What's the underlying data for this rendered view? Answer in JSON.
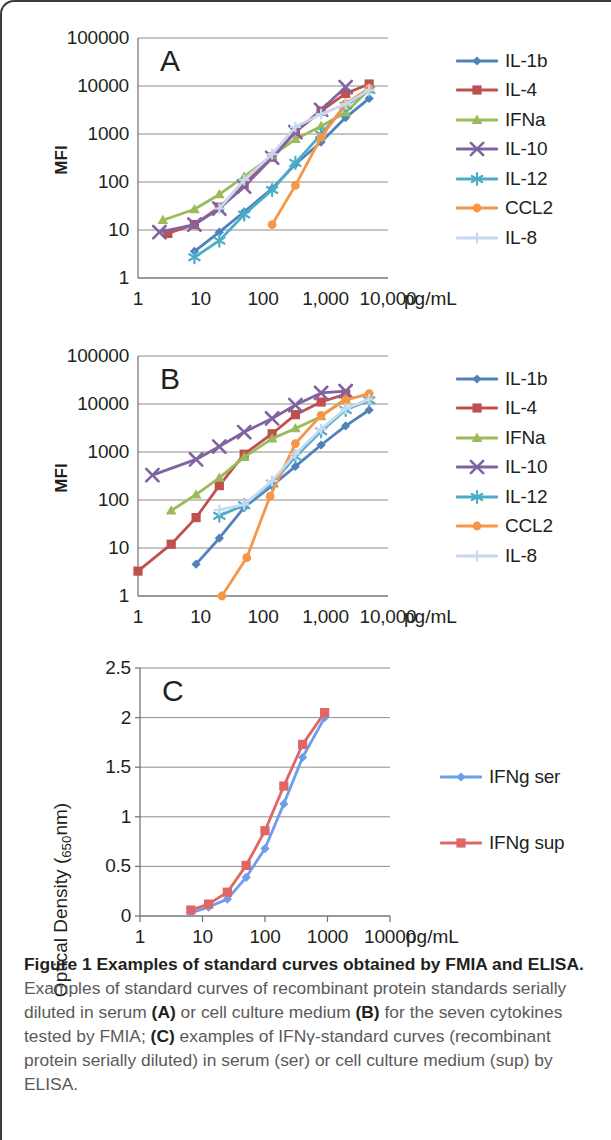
{
  "figure": {
    "caption_lead": "Figure 1 Examples of standard curves obtained by FMIA and ELISA.",
    "caption_body_1": " Examples of standard curves of recombinant protein standards serially diluted in serum ",
    "caption_ref_a": "(A)",
    "caption_body_2": " or cell culture medium ",
    "caption_ref_b": "(B)",
    "caption_body_3": " for the seven cytokines tested by FMIA; ",
    "caption_ref_c": "(C)",
    "caption_body_4": " examples of IFNγ-standard curves (recombinant protein serially diluted) in serum (ser) or cell culture medium (sup) by ELISA."
  },
  "colors": {
    "il1b": "#4f81bd",
    "il4": "#c0504d",
    "ifna": "#9bbb59",
    "il10": "#8064a2",
    "il12": "#4bacc6",
    "ccl2": "#f79646",
    "il8": "#c6d9f0",
    "ifng_ser": "#6d9eeb",
    "ifng_sup": "#e06666",
    "grid": "#808080",
    "axis": "#808080",
    "text": "#231f20"
  },
  "chart_data": [
    {
      "id": "panel-a",
      "type": "line",
      "panel_letter": "A",
      "title": "",
      "xlabel": "pg/mL",
      "ylabel": "MFI",
      "xscale": "log",
      "yscale": "log",
      "xlim": [
        1,
        10000
      ],
      "ylim": [
        1,
        100000
      ],
      "xticks": [
        1,
        10,
        100,
        1000,
        10000
      ],
      "xticklabels": [
        "1",
        "10",
        "100",
        "1,000",
        "10,000"
      ],
      "xunit_label": "pg/mL",
      "yticks": [
        1,
        10,
        100,
        1000,
        10000,
        100000
      ],
      "yticklabels": [
        "1",
        "10",
        "100",
        "1000",
        "10000",
        "100000"
      ],
      "grid": true,
      "legend_position": "right",
      "series": [
        {
          "name": "IL-1b",
          "color": "#4f81bd",
          "marker": "diamond",
          "x": [
            8,
            20,
            50,
            140,
            330,
            850,
            2100,
            5000
          ],
          "y": [
            3.6,
            9,
            24,
            73,
            235,
            680,
            2200,
            5500
          ]
        },
        {
          "name": "IL-4",
          "color": "#c0504d",
          "marker": "square",
          "x": [
            3,
            8,
            20,
            50,
            140,
            330,
            850,
            2100,
            5000
          ],
          "y": [
            8.5,
            13,
            30,
            90,
            330,
            1100,
            3000,
            7000,
            11000
          ]
        },
        {
          "name": "IFNa",
          "color": "#9bbb59",
          "marker": "triangle",
          "x": [
            2.5,
            8,
            20,
            50,
            140,
            330,
            850,
            2100,
            5000
          ],
          "y": [
            16,
            27,
            55,
            130,
            350,
            780,
            1450,
            2800,
            8500
          ]
        },
        {
          "name": "IL-10",
          "color": "#8064a2",
          "marker": "x",
          "x": [
            2.2,
            8,
            20,
            50,
            140,
            330,
            850,
            2100
          ],
          "y": [
            9,
            13,
            28,
            80,
            320,
            1100,
            3200,
            9500
          ]
        },
        {
          "name": "IL-12",
          "color": "#4bacc6",
          "marker": "asterisk",
          "x": [
            8,
            20,
            50,
            140,
            330,
            850,
            2100,
            5000
          ],
          "y": [
            2.7,
            6,
            21,
            68,
            250,
            980,
            3900,
            8300
          ]
        },
        {
          "name": "CCL2",
          "color": "#f79646",
          "marker": "circle",
          "x": [
            140,
            330,
            850,
            2100,
            5000
          ],
          "y": [
            13,
            85,
            850,
            4300,
            9000
          ]
        },
        {
          "name": "IL-8",
          "color": "#c6d9f0",
          "marker": "plus",
          "x": [
            20,
            50,
            140,
            330,
            850,
            2100,
            5000
          ],
          "y": [
            28,
            110,
            380,
            1400,
            2600,
            4200,
            8200
          ]
        }
      ]
    },
    {
      "id": "panel-b",
      "type": "line",
      "panel_letter": "B",
      "title": "",
      "xlabel": "pg/mL",
      "ylabel": "MFI",
      "xscale": "log",
      "yscale": "log",
      "xlim": [
        1,
        10000
      ],
      "ylim": [
        1,
        100000
      ],
      "xticks": [
        1,
        10,
        100,
        1000,
        10000
      ],
      "xticklabels": [
        "1",
        "10",
        "100",
        "1,000",
        "10,000"
      ],
      "xunit_label": "pg/mL",
      "yticks": [
        1,
        10,
        100,
        1000,
        10000,
        100000
      ],
      "yticklabels": [
        "1",
        "10",
        "100",
        "1000",
        "10000",
        "100000"
      ],
      "grid": true,
      "legend_position": "right",
      "series": [
        {
          "name": "IL-1b",
          "color": "#4f81bd",
          "marker": "diamond",
          "x": [
            8.5,
            20,
            50,
            140,
            330,
            850,
            2100,
            5000
          ],
          "y": [
            4.6,
            16,
            70,
            200,
            500,
            1400,
            3500,
            7500
          ]
        },
        {
          "name": "IL-4",
          "color": "#c0504d",
          "marker": "square",
          "x": [
            1,
            3.4,
            8.5,
            20,
            50,
            140,
            330,
            850,
            2100
          ],
          "y": [
            3.3,
            12,
            43,
            200,
            900,
            2400,
            6000,
            11000,
            16000
          ]
        },
        {
          "name": "IFNa",
          "color": "#9bbb59",
          "marker": "triangle",
          "x": [
            3.4,
            8.5,
            20,
            50,
            140,
            330,
            850,
            2100
          ],
          "y": [
            60,
            130,
            290,
            780,
            1900,
            3100,
            5500,
            13000
          ]
        },
        {
          "name": "IL-10",
          "color": "#8064a2",
          "marker": "x",
          "x": [
            1.7,
            8.5,
            20,
            50,
            140,
            330,
            850,
            2100
          ],
          "y": [
            330,
            700,
            1300,
            2600,
            5000,
            9500,
            17000,
            18500
          ]
        },
        {
          "name": "IL-12",
          "color": "#4bacc6",
          "marker": "asterisk",
          "x": [
            20,
            50,
            140,
            330,
            850,
            2100,
            5000
          ],
          "y": [
            47,
            78,
            220,
            800,
            2700,
            7500,
            12000
          ]
        },
        {
          "name": "CCL2",
          "color": "#f79646",
          "marker": "circle",
          "x": [
            22,
            55,
            130,
            330,
            850,
            2100,
            5000
          ],
          "y": [
            1,
            6.3,
            120,
            1500,
            5800,
            12000,
            16500
          ]
        },
        {
          "name": "IL-8",
          "color": "#c6d9f0",
          "marker": "plus",
          "x": [
            20,
            50,
            140,
            330,
            850,
            2100,
            5000
          ],
          "y": [
            62,
            80,
            250,
            900,
            3000,
            8000,
            12500
          ]
        }
      ]
    },
    {
      "id": "panel-c",
      "type": "line",
      "panel_letter": "C",
      "title": "",
      "xlabel": "pg/mL",
      "ylabel": "Optical Density (",
      "ylabel_sub": "650",
      "ylabel_tail": "nm)",
      "xscale": "log",
      "yscale": "linear",
      "xlim": [
        1,
        10000
      ],
      "ylim": [
        0,
        2.5
      ],
      "xticks": [
        1,
        10,
        100,
        1000,
        10000
      ],
      "xticklabels": [
        "1",
        "10",
        "100",
        "1000",
        "10000"
      ],
      "xunit_label": "pg/mL",
      "yticks": [
        0,
        0.5,
        1,
        1.5,
        2,
        2.5
      ],
      "yticklabels": [
        "0",
        "0.5",
        "1",
        "1.5",
        "2",
        "2.5"
      ],
      "grid": true,
      "legend_position": "right",
      "series": [
        {
          "name": "IFNg ser",
          "color": "#6d9eeb",
          "marker": "diamond",
          "x": [
            6.5,
            12.5,
            25,
            50,
            100,
            200,
            400,
            900
          ],
          "y": [
            0.03,
            0.09,
            0.17,
            0.39,
            0.68,
            1.13,
            1.6,
            2.0
          ]
        },
        {
          "name": "IFNg sup",
          "color": "#e06666",
          "marker": "square",
          "x": [
            6.5,
            12.5,
            25,
            50,
            100,
            200,
            400,
            900
          ],
          "y": [
            0.06,
            0.12,
            0.24,
            0.51,
            0.86,
            1.31,
            1.73,
            2.05
          ]
        }
      ]
    }
  ],
  "legends": {
    "panel_a": [
      "IL-1b",
      "IL-4",
      "IFNa",
      "IL-10",
      "IL-12",
      "CCL2",
      "IL-8"
    ],
    "panel_b": [
      "IL-1b",
      "IL-4",
      "IFNa",
      "IL-10",
      "IL-12",
      "CCL2",
      "IL-8"
    ],
    "panel_c": [
      "IFNg ser",
      "IFNg sup"
    ]
  }
}
